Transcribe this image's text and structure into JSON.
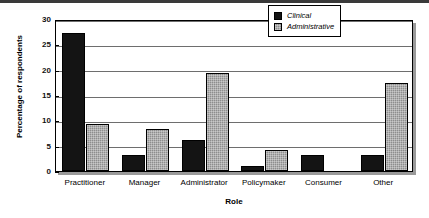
{
  "chart_data": {
    "type": "bar",
    "title": "",
    "xlabel": "Role",
    "ylabel": "Percentage of respondents",
    "categories": [
      "Practitioner",
      "Manager",
      "Administrator",
      "Policymaker",
      "Consumer",
      "Other"
    ],
    "series": [
      {
        "name": "Clinical",
        "color": "#141414",
        "values": [
          27.3,
          3.1,
          6.2,
          1.0,
          3.2,
          3.2
        ]
      },
      {
        "name": "Administrative",
        "color": "#8e8e8e",
        "values": [
          9.3,
          8.3,
          19.3,
          4.2,
          0,
          17.3
        ]
      }
    ],
    "ylim": [
      0,
      30
    ],
    "yticks": [
      0,
      5,
      10,
      15,
      20,
      25,
      30
    ],
    "ytick_labels": [
      "0",
      "5",
      "10",
      "15",
      "20",
      "25",
      "30"
    ],
    "grid": "horizontal",
    "legend_position": "top-right",
    "legend_italic": true
  }
}
